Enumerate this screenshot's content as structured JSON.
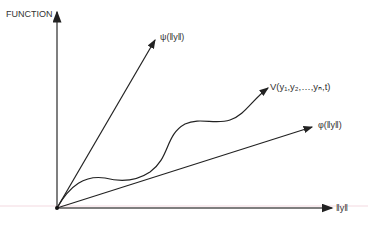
{
  "diagram": {
    "y_axis_label": "FUNCTION",
    "x_axis_label": "‖y‖",
    "curves": [
      {
        "id": "psi",
        "label": "ψ(‖y‖)",
        "type": "straight-line"
      },
      {
        "id": "V",
        "label": "V(y₁,y₂,…,yₙ,t)",
        "type": "wavy-curve"
      },
      {
        "id": "phi",
        "label": "φ(‖y‖)",
        "type": "straight-line"
      }
    ]
  }
}
